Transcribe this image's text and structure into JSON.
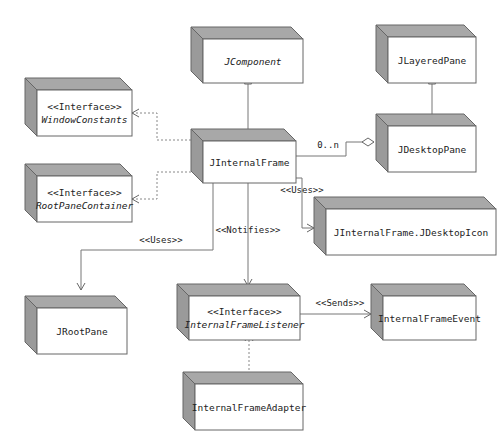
{
  "diagram": {
    "type": "UML class diagram",
    "nodes": [
      {
        "id": "jcomponent",
        "lines": [
          "JComponent"
        ],
        "italic": [
          true
        ]
      },
      {
        "id": "jlayeredpane",
        "lines": [
          "JLayeredPane"
        ],
        "italic": [
          false
        ]
      },
      {
        "id": "windowconstants",
        "lines": [
          "<<Interface>>",
          "WindowConstants"
        ],
        "italic": [
          false,
          true
        ]
      },
      {
        "id": "jdesktoppane",
        "lines": [
          "JDesktopPane"
        ],
        "italic": [
          false
        ]
      },
      {
        "id": "jinternalframe",
        "lines": [
          "JInternalFrame"
        ],
        "italic": [
          false
        ]
      },
      {
        "id": "rootpanecontainer",
        "lines": [
          "<<Interface>>",
          "RootPaneContainer"
        ],
        "italic": [
          false,
          true
        ]
      },
      {
        "id": "jdesktopicon",
        "lines": [
          "JInternalFrame.JDesktopIcon"
        ],
        "italic": [
          false
        ]
      },
      {
        "id": "jrootpane",
        "lines": [
          "JRootPane"
        ],
        "italic": [
          false
        ]
      },
      {
        "id": "internalframelistener",
        "lines": [
          "<<Interface>>",
          "InternalFrameListener"
        ],
        "italic": [
          false,
          true
        ]
      },
      {
        "id": "internalframeevent",
        "lines": [
          "InternalFrameEvent"
        ],
        "italic": [
          false
        ]
      },
      {
        "id": "internalframeadapter",
        "lines": [
          "InternalFrameAdapter"
        ],
        "italic": [
          false
        ]
      }
    ],
    "edges": [
      {
        "from": "jinternalframe",
        "to": "jcomponent",
        "kind": "generalization",
        "label": ""
      },
      {
        "from": "jdesktoppane",
        "to": "jlayeredpane",
        "kind": "generalization",
        "label": ""
      },
      {
        "from": "jinternalframe",
        "to": "windowconstants",
        "kind": "realization",
        "label": ""
      },
      {
        "from": "jinternalframe",
        "to": "rootpanecontainer",
        "kind": "realization",
        "label": ""
      },
      {
        "from": "jinternalframe",
        "to": "jdesktoppane",
        "kind": "aggregation",
        "label": "0..n"
      },
      {
        "from": "jinternalframe",
        "to": "jdesktopicon",
        "kind": "dependency",
        "label": "<<Uses>>"
      },
      {
        "from": "jinternalframe",
        "to": "jrootpane",
        "kind": "dependency",
        "label": "<<Uses>>"
      },
      {
        "from": "jinternalframe",
        "to": "internalframelistener",
        "kind": "dependency",
        "label": "<<Notifies>>"
      },
      {
        "from": "internalframelistener",
        "to": "internalframeevent",
        "kind": "dependency",
        "label": "<<Sends>>"
      },
      {
        "from": "internalframeadapter",
        "to": "internalframelistener",
        "kind": "realization",
        "label": ""
      }
    ]
  }
}
